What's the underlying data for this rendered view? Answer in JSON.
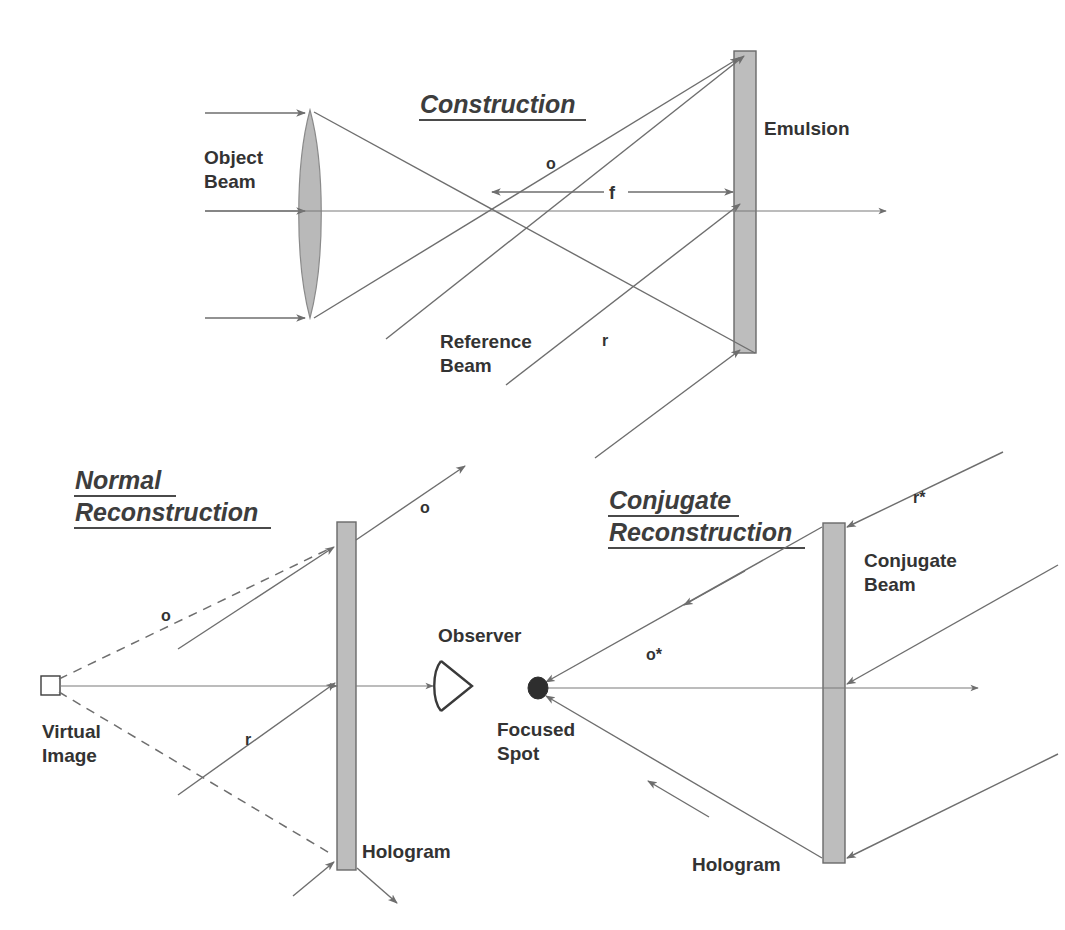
{
  "figure": {
    "background_color": "#ffffff",
    "ink_color": "#333333",
    "ray_color": "#6e6e6e",
    "plate_fill": "#bdbdbd",
    "lens_fill": "#b9b9b9",
    "width": 1065,
    "height": 930
  },
  "panels": {
    "construction": {
      "title": "Construction",
      "labels": {
        "object_beam": "Object\nBeam",
        "object_beam_line1": "Object",
        "object_beam_line2": "Beam",
        "reference_beam_line1": "Reference",
        "reference_beam_line2": "Beam",
        "emulsion": "Emulsion",
        "object_wave": "o",
        "reference_wave": "r",
        "focal_length": "f"
      },
      "elements": {
        "lens": "converging-lens",
        "plate": "emulsion-plate"
      }
    },
    "normal_reconstruction": {
      "title_line1": "Normal",
      "title_line2": "Reconstruction",
      "labels": {
        "virtual_image_line1": "Virtual",
        "virtual_image_line2": "Image",
        "observer": "Observer",
        "hologram": "Hologram",
        "object_wave_upper": "o",
        "object_wave_virtual": "o",
        "reference_wave": "r"
      },
      "elements": {
        "plate": "hologram-plate",
        "marker": "virtual-image-speckle",
        "viewer": "observer-eye"
      }
    },
    "conjugate_reconstruction": {
      "title_line1": "Conjugate",
      "title_line2": "Reconstruction",
      "labels": {
        "focused_spot_line1": "Focused",
        "focused_spot_line2": "Spot",
        "conjugate_beam_line1": "Conjugate",
        "conjugate_beam_line2": "Beam",
        "hologram": "Hologram",
        "conjugate_reference_wave": "r*",
        "conjugate_object_wave": "o*"
      },
      "elements": {
        "plate": "hologram-plate",
        "marker": "focused-spot"
      }
    }
  }
}
